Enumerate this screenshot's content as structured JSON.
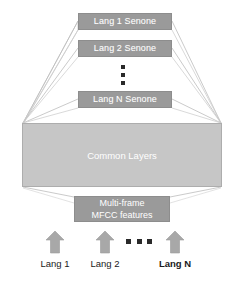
{
  "diagram": {
    "type": "block-diagram",
    "canvas": {
      "width": 239,
      "height": 281
    },
    "colors": {
      "output_block_fill": "#9a9a9a",
      "common_block_fill": "#c6c6c6",
      "block_text": "#ffffff",
      "edge_line": "#b9b9b9",
      "arrow_fill": "#a8a8a8",
      "dot": "#2a2a2a",
      "label_text": "#1a1a1a",
      "background": "#ffffff"
    },
    "output_layers": [
      {
        "label": "Lang 1 Senone"
      },
      {
        "label": "Lang 2 Senone"
      },
      {
        "label": "Lang N Senone"
      }
    ],
    "vertical_ellipsis": "⋮",
    "shared_block": {
      "label": "Common Layers"
    },
    "input_block": {
      "line1": "Multi-frame",
      "line2": "MFCC features"
    },
    "horizontal_ellipsis": "…",
    "inputs": [
      {
        "label": "Lang 1",
        "bold": false
      },
      {
        "label": "Lang 2",
        "bold": false
      },
      {
        "label": "Lang N",
        "bold": true
      }
    ]
  }
}
